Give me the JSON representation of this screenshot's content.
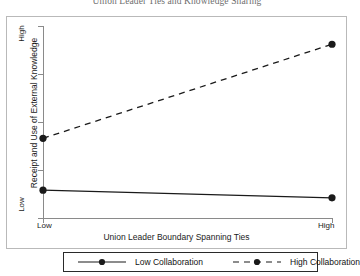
{
  "chart_data": {
    "type": "line",
    "title": "Union Leader Ties and Knowledge Sharing",
    "xlabel": "Union Leader Boundary Spanning Ties",
    "ylabel": "Receipt and Use of External Knowledge",
    "categories": [
      "Low",
      "High"
    ],
    "x_tick_labels": [
      "Low",
      "High"
    ],
    "y_tick_labels": [
      "Low",
      "High"
    ],
    "xlim": [
      "Low",
      "High"
    ],
    "ylim": [
      "Low",
      "High"
    ],
    "grid": false,
    "legend_position": "bottom",
    "series": [
      {
        "name": "Low Collaboration",
        "values": [
          0.145,
          0.105
        ],
        "linestyle": "solid",
        "marker": "filled-circle",
        "color": "#1a1a1a"
      },
      {
        "name": "High Collaboration",
        "values": [
          0.415,
          0.905
        ],
        "linestyle": "dashed",
        "marker": "filled-circle",
        "color": "#1a1a1a"
      }
    ]
  },
  "chart": {
    "title": "Union Leader Ties and Knowledge Sharing",
    "y_axis": {
      "label": "Receipt and Use of External Knowledge",
      "tick_high": "High",
      "tick_low": "Low"
    },
    "x_axis": {
      "label": "Union Leader Boundary Spanning Ties",
      "tick_low": "Low",
      "tick_high": "High"
    },
    "legend": {
      "entries": [
        {
          "label": "Low Collaboration",
          "style": "solid"
        },
        {
          "label": "High Collaboration",
          "style": "dashed"
        }
      ]
    },
    "colors": {
      "series": "#1a1a1a",
      "axis": "#8a8a8a",
      "frame": "#b9b9b9",
      "title": "#6f6f6f"
    }
  }
}
